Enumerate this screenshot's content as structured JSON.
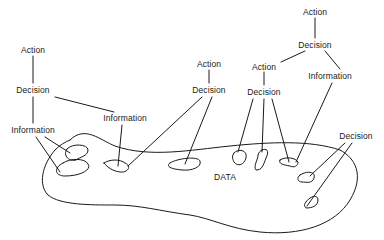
{
  "diagram": {
    "type": "hierarchy-to-data",
    "region_label": "DATA",
    "nodes": [
      {
        "id": "a1",
        "label": "Action",
        "x": 315,
        "y": 12
      },
      {
        "id": "d1",
        "label": "Decision",
        "x": 315,
        "y": 45
      },
      {
        "id": "a2",
        "label": "Action",
        "x": 264,
        "y": 67
      },
      {
        "id": "d2",
        "label": "Decision",
        "x": 264,
        "y": 92
      },
      {
        "id": "i1",
        "label": "Information",
        "x": 330,
        "y": 76
      },
      {
        "id": "a3",
        "label": "Action",
        "x": 209,
        "y": 64
      },
      {
        "id": "d3",
        "label": "Decision",
        "x": 209,
        "y": 90
      },
      {
        "id": "a4",
        "label": "Action",
        "x": 33,
        "y": 50
      },
      {
        "id": "d4",
        "label": "Decision",
        "x": 33,
        "y": 90
      },
      {
        "id": "i2",
        "label": "Information",
        "x": 33,
        "y": 130
      },
      {
        "id": "i3",
        "label": "Information",
        "x": 125,
        "y": 118
      },
      {
        "id": "d5",
        "label": "Decision",
        "x": 356,
        "y": 136
      }
    ],
    "edges": [
      [
        "a1",
        "d1"
      ],
      [
        "d1",
        "a2"
      ],
      [
        "d1",
        "i1"
      ],
      [
        "a2",
        "d2"
      ],
      [
        "a3",
        "d3"
      ],
      [
        "a4",
        "d4"
      ],
      [
        "d4",
        "i2"
      ],
      [
        "d4",
        "i3"
      ],
      [
        "i2",
        "blob-1"
      ],
      [
        "i2",
        "blob-2"
      ],
      [
        "i3",
        "blob-3"
      ],
      [
        "d3",
        "blob-3"
      ],
      [
        "d3",
        "blob-4"
      ],
      [
        "d2",
        "blob-5"
      ],
      [
        "d2",
        "blob-6"
      ],
      [
        "d2",
        "blob-7"
      ],
      [
        "i1",
        "blob-7"
      ],
      [
        "d5",
        "blob-8"
      ],
      [
        "d5",
        "blob-9"
      ]
    ]
  }
}
